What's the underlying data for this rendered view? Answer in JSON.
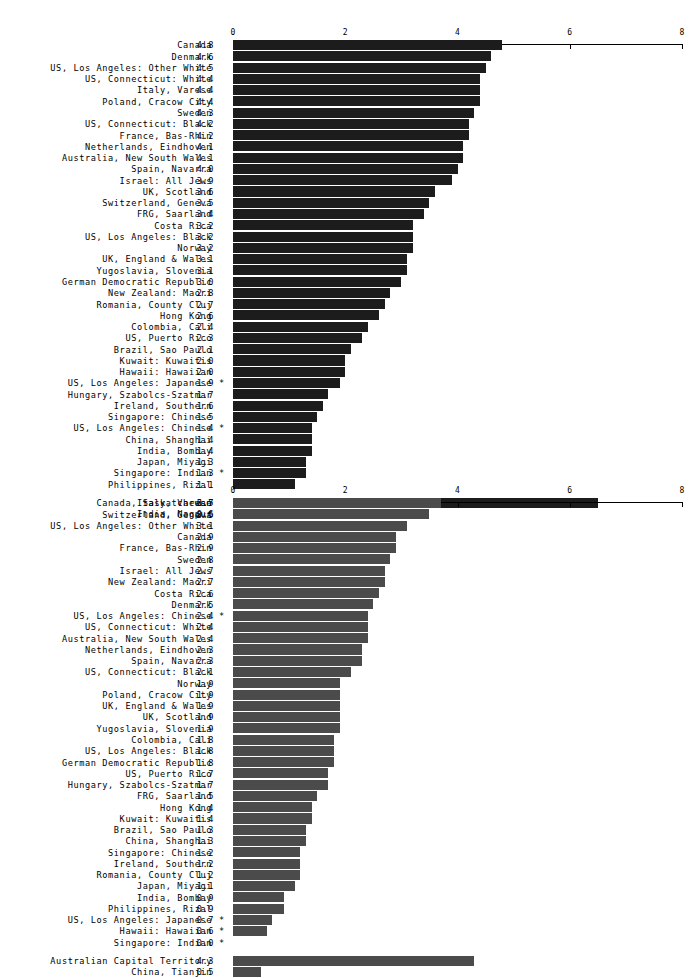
{
  "page": {
    "background": "#ffffff",
    "text_color": "#000000"
  },
  "axis": {
    "ticks": [
      0,
      2,
      4,
      6,
      8
    ],
    "tick_labels": [
      "0",
      "2",
      "4",
      "6",
      "8"
    ],
    "min": 0,
    "max": 8
  },
  "chart_data": [
    {
      "id": "chart-1",
      "type": "bar",
      "orientation": "horizontal",
      "title": "",
      "xlabel": "",
      "ylabel": "",
      "xlim": [
        0,
        8
      ],
      "grid": false,
      "legend": null,
      "bar_color": "#1c1c1c",
      "categories": [
        "Canada",
        "Denmark",
        "US, Los Angeles: Other White",
        "US, Connecticut: White",
        "Italy, Varese",
        "Poland, Cracow City",
        "Sweden",
        "US, Connecticut: Black",
        "France, Bas-Rhin",
        "Netherlands, Eindhoven",
        "Australia, New South Wales",
        "Spain, Navarra",
        "Israel: All Jews",
        "UK, Scotland",
        "Switzerland, Geneva",
        "FRG, Saarland",
        "Costa Rica",
        "US, Los Angeles: Black",
        "Norway",
        "UK, England & Wales",
        "Yugoslavia, Slovenia",
        "German Democratic Republic",
        "New Zealand: Maori",
        "Romania, County Cluj",
        "Hong Kong",
        "Colombia, Cali",
        "US, Puerto Rico",
        "Brazil, Sao Paulo",
        "Kuwait: Kuwaitis",
        "Hawaii: Hawaiian",
        "US, Los Angeles: Japanese",
        "Hungary, Szabolcs-Szatmar",
        "Ireland, Southern",
        "Singapore: Chinese",
        "US, Los Angeles: Chinese",
        "China, Shanghai",
        "India, Bombay",
        "Japan, Miyagi",
        "Singapore: Indian",
        "Philippines, Rizal"
      ],
      "values": [
        4.8,
        4.6,
        4.5,
        4.4,
        4.4,
        4.4,
        4.3,
        4.2,
        4.2,
        4.1,
        4.1,
        4.0,
        3.9,
        3.6,
        3.5,
        3.4,
        3.2,
        3.2,
        3.2,
        3.1,
        3.1,
        3.0,
        2.8,
        2.7,
        2.6,
        2.4,
        2.3,
        2.1,
        2.0,
        2.0,
        1.9,
        1.7,
        1.6,
        1.5,
        1.4,
        1.4,
        1.4,
        1.3,
        1.3,
        1.1
      ],
      "value_labels": [
        "4.8",
        "4.6",
        "4.5",
        "4.4",
        "4.4",
        "4.4",
        "4.3",
        "4.2",
        "4.2",
        "4.1",
        "4.1",
        "4.0",
        "3.9",
        "3.6",
        "3.5",
        "3.4",
        "3.2",
        "3.2",
        "3.2",
        "3.1",
        "3.1",
        "3.0",
        "2.8",
        "2.7",
        "2.6",
        "2.4",
        "2.3",
        "2.1",
        "2.0",
        "2.0",
        "1.9",
        "1.7",
        "1.6",
        "1.5",
        "1.4",
        "1.4",
        "1.4",
        "1.3",
        "1.3",
        "1.1"
      ],
      "markers": [
        "",
        "",
        "",
        "",
        "",
        "",
        "",
        "",
        "",
        "",
        "",
        "",
        "",
        "",
        "",
        "",
        "",
        "",
        "",
        "",
        "",
        "",
        "",
        "",
        "",
        "",
        "",
        "",
        "",
        "",
        "*",
        "",
        "",
        "",
        "*",
        "",
        "",
        "",
        "*",
        ""
      ],
      "extra_categories": [
        "Canada, Saskatchewan",
        "India, Nagpur"
      ],
      "extra_values": [
        6.5,
        0.6
      ],
      "extra_value_labels": [
        "6.5",
        "0.6"
      ],
      "extra_markers": [
        "",
        ""
      ]
    },
    {
      "id": "chart-2",
      "type": "bar",
      "orientation": "horizontal",
      "title": "",
      "xlabel": "",
      "ylabel": "",
      "xlim": [
        0,
        8
      ],
      "grid": false,
      "legend": null,
      "bar_color": "#4b4b4b",
      "categories": [
        "Italy, Varese",
        "Switzerland, Geneva",
        "US, Los Angeles: Other White",
        "Canada",
        "France, Bas-Rhin",
        "Sweden",
        "Israel: All Jews",
        "New Zealand: Maori",
        "Costa Rica",
        "Denmark",
        "US, Los Angeles: Chinese",
        "US, Connecticut: White",
        "Australia, New South Wales",
        "Netherlands, Eindhoven",
        "Spain, Navarra",
        "US, Connecticut: Black",
        "Norway",
        "Poland, Cracow City",
        "UK, England & Wales",
        "UK, Scotland",
        "Yugoslavia, Slovenia",
        "Colombia, Cali",
        "US, Los Angeles: Black",
        "German Democratic Republic",
        "US, Puerto Rico",
        "Hungary, Szabolcs-Szatmar",
        "FRG, Saarland",
        "Hong Kong",
        "Kuwait: Kuwaitis",
        "Brazil, Sao Paulo",
        "China, Shanghai",
        "Singapore: Chinese",
        "Ireland, Southern",
        "Romania, County Cluj",
        "Japan, Miyagi",
        "India, Bombay",
        "Philippines, Rizal",
        "US, Los Angeles: Japanese",
        "Hawaii: Hawaiian",
        "Singapore: Indian"
      ],
      "values": [
        3.7,
        3.5,
        3.1,
        2.9,
        2.9,
        2.8,
        2.7,
        2.7,
        2.6,
        2.5,
        2.4,
        2.4,
        2.4,
        2.3,
        2.3,
        2.1,
        1.9,
        1.9,
        1.9,
        1.9,
        1.9,
        1.8,
        1.8,
        1.8,
        1.7,
        1.7,
        1.5,
        1.4,
        1.4,
        1.3,
        1.3,
        1.2,
        1.2,
        1.2,
        1.1,
        0.9,
        0.9,
        0.7,
        0.6,
        0.0
      ],
      "value_labels": [
        "3.7",
        "3.5",
        "3.1",
        "2.9",
        "2.9",
        "2.8",
        "2.7",
        "2.7",
        "2.6",
        "2.5",
        "2.4",
        "2.4",
        "2.4",
        "2.3",
        "2.3",
        "2.1",
        "1.9",
        "1.9",
        "1.9",
        "1.9",
        "1.9",
        "1.8",
        "1.8",
        "1.8",
        "1.7",
        "1.7",
        "1.5",
        "1.4",
        "1.4",
        "1.3",
        "1.3",
        "1.2",
        "1.2",
        "1.2",
        "1.1",
        "0.9",
        "0.9",
        "0.7",
        "0.6",
        "0.0"
      ],
      "markers": [
        "",
        "",
        "",
        "",
        "",
        "",
        "",
        "",
        "",
        "",
        "*",
        "",
        "",
        "",
        "",
        "",
        "",
        "",
        "",
        "",
        "",
        "",
        "",
        "",
        "",
        "",
        "",
        "",
        "",
        "",
        "",
        "",
        "",
        "",
        "",
        "",
        "",
        "*",
        "*",
        "*"
      ],
      "extra_categories": [
        "Australian Capital Territory",
        "China, Tianjin"
      ],
      "extra_values": [
        4.3,
        0.5
      ],
      "extra_value_labels": [
        "4.3",
        "0.5"
      ],
      "extra_markers": [
        "",
        ""
      ]
    }
  ]
}
